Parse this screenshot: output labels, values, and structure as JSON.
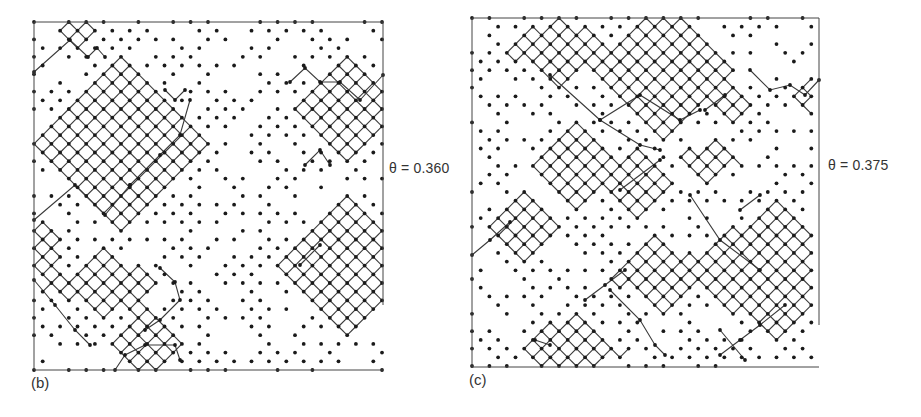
{
  "figure": {
    "panels": [
      {
        "id": "b",
        "label": "(b)",
        "theta_label": "θ = 0.360",
        "theta": 0.36,
        "frame": {
          "x": 34,
          "y": 22,
          "w": 349,
          "h": 348
        },
        "open_edges": {
          "right_bottom_gap_from_y": 305
        },
        "lattice": {
          "origin_x": 34,
          "origin_y": 22,
          "step": 8.7,
          "cols": 40,
          "rows": 40,
          "seed": 7
        },
        "clusters": [
          {
            "cx": 120,
            "cy": 150,
            "rx": 5,
            "ry": 5
          },
          {
            "cx": 345,
            "cy": 110,
            "rx": 3,
            "ry": 3
          },
          {
            "cx": 75,
            "cy": 35,
            "rx": 1,
            "ry": 1
          },
          {
            "cx": 350,
            "cy": 265,
            "rx": 4,
            "ry": 4
          },
          {
            "cx": 105,
            "cy": 285,
            "rx": 3,
            "ry": 2
          },
          {
            "cx": 145,
            "cy": 345,
            "rx": 2,
            "ry": 2
          },
          {
            "cx": 45,
            "cy": 255,
            "rx": 1,
            "ry": 2
          }
        ],
        "paths": [
          [
            [
              34,
              72
            ],
            [
              70,
              40
            ],
            [
              88,
              57
            ],
            [
              97,
              48
            ],
            [
              105,
              57
            ]
          ],
          [
            [
              34,
              220
            ],
            [
              75,
              185
            ],
            [
              105,
              215
            ],
            [
              130,
              185
            ]
          ],
          [
            [
              130,
              185
            ],
            [
              160,
              155
            ],
            [
              180,
              135
            ],
            [
              190,
              100
            ]
          ],
          [
            [
              165,
              90
            ],
            [
              175,
              100
            ],
            [
              185,
              90
            ]
          ],
          [
            [
              290,
              82
            ],
            [
              305,
              68
            ],
            [
              320,
              82
            ],
            [
              340,
              82
            ],
            [
              360,
              100
            ],
            [
              383,
              75
            ]
          ],
          [
            [
              305,
              165
            ],
            [
              320,
              150
            ],
            [
              330,
              165
            ]
          ],
          [
            [
              300,
              265
            ],
            [
              320,
              245
            ]
          ],
          [
            [
              34,
              280
            ],
            [
              55,
              305
            ],
            [
              75,
              330
            ],
            [
              90,
              345
            ]
          ],
          [
            [
              160,
              268
            ],
            [
              175,
              282
            ],
            [
              180,
              300
            ],
            [
              160,
              320
            ],
            [
              145,
              330
            ]
          ],
          [
            [
              115,
              370
            ],
            [
              125,
              355
            ],
            [
              145,
              345
            ],
            [
              175,
              345
            ],
            [
              180,
              360
            ]
          ]
        ]
      },
      {
        "id": "c",
        "label": "(c)",
        "theta_label": "θ = 0.375",
        "theta": 0.375,
        "frame": {
          "x": 472,
          "y": 18,
          "w": 347,
          "h": 349
        },
        "open_edges": {
          "right_bottom_gap_from_y": 325
        },
        "lattice": {
          "origin_x": 472,
          "origin_y": 18,
          "step": 8.7,
          "cols": 40,
          "rows": 40,
          "seed": 13
        },
        "clusters": [
          {
            "cx": 560,
            "cy": 50,
            "rx": 3,
            "ry": 2
          },
          {
            "cx": 665,
            "cy": 70,
            "rx": 4,
            "ry": 4
          },
          {
            "cx": 575,
            "cy": 165,
            "rx": 2,
            "ry": 3
          },
          {
            "cx": 640,
            "cy": 180,
            "rx": 2,
            "ry": 2
          },
          {
            "cx": 520,
            "cy": 225,
            "rx": 2,
            "ry": 2
          },
          {
            "cx": 660,
            "cy": 275,
            "rx": 3,
            "ry": 2
          },
          {
            "cx": 775,
            "cy": 270,
            "rx": 5,
            "ry": 4
          },
          {
            "cx": 570,
            "cy": 350,
            "rx": 3,
            "ry": 2
          },
          {
            "cx": 710,
            "cy": 160,
            "rx": 2,
            "ry": 1
          },
          {
            "cx": 805,
            "cy": 95,
            "rx": 1,
            "ry": 1
          },
          {
            "cx": 735,
            "cy": 110,
            "rx": 1,
            "ry": 1
          }
        ],
        "paths": [
          [
            [
              472,
              255
            ],
            [
              490,
              240
            ],
            [
              510,
              222
            ]
          ],
          [
            [
              550,
              75
            ],
            [
              600,
              120
            ],
            [
              640,
              95
            ],
            [
              680,
              120
            ],
            [
              700,
              110
            ]
          ],
          [
            [
              600,
              120
            ],
            [
              640,
              145
            ],
            [
              660,
              150
            ]
          ],
          [
            [
              620,
              190
            ],
            [
              660,
              160
            ]
          ],
          [
            [
              690,
              195
            ],
            [
              720,
              240
            ],
            [
              760,
              270
            ]
          ],
          [
            [
              740,
              210
            ],
            [
              760,
              195
            ]
          ],
          [
            [
              750,
              70
            ],
            [
              770,
              90
            ],
            [
              790,
              85
            ],
            [
              805,
              95
            ],
            [
              819,
              80
            ]
          ],
          [
            [
              705,
              110
            ],
            [
              725,
              95
            ]
          ],
          [
            [
              610,
              290
            ],
            [
              640,
              320
            ],
            [
              655,
              345
            ],
            [
              665,
              355
            ]
          ],
          [
            [
              720,
              355
            ],
            [
              740,
              340
            ],
            [
              760,
              325
            ],
            [
              785,
              305
            ]
          ],
          [
            [
              720,
              330
            ],
            [
              745,
              360
            ]
          ],
          [
            [
              535,
              340
            ],
            [
              550,
              345
            ]
          ],
          [
            [
              585,
              300
            ],
            [
              605,
              285
            ],
            [
              625,
              270
            ]
          ]
        ]
      }
    ]
  },
  "colors": {
    "ink": "#1a1a1a",
    "frame": "#444444",
    "text": "#333333",
    "bond": "#3a3a3a"
  }
}
